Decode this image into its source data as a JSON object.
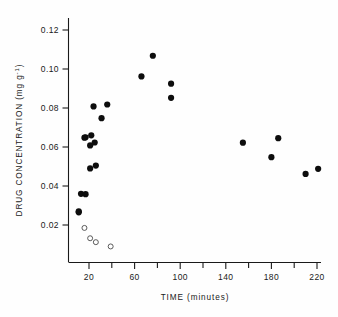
{
  "chart_data": {
    "type": "scatter",
    "title": "",
    "xlabel": "TIME  (minutes)",
    "ylabel": "DRUG CONCENTRATION  (mg g",
    "ylabel_superscript": "-1",
    "ylabel_suffix": ")",
    "xlim": [
      8,
      228
    ],
    "ylim": [
      0.0,
      0.128
    ],
    "xticks": [
      20,
      60,
      100,
      140,
      180,
      220
    ],
    "xtick_labels": [
      "20",
      "60",
      "100",
      "140",
      "180",
      "220"
    ],
    "xminor_ticks": [
      40,
      80,
      120,
      160,
      200
    ],
    "yticks": [
      0.02,
      0.04,
      0.06,
      0.08,
      0.1,
      0.12
    ],
    "ytick_labels": [
      "0.02",
      "0.04",
      "0.06",
      "0.08",
      "0.10",
      "0.12"
    ],
    "grid": false,
    "legend": null,
    "series": [
      {
        "name": "filled-markers",
        "marker": "filled-circle",
        "color": "#0d0d0d",
        "points": [
          {
            "x": 11,
            "y": 0.0265
          },
          {
            "x": 11,
            "y": 0.027
          },
          {
            "x": 13,
            "y": 0.036
          },
          {
            "x": 17,
            "y": 0.0358
          },
          {
            "x": 16,
            "y": 0.0648
          },
          {
            "x": 17,
            "y": 0.065
          },
          {
            "x": 21,
            "y": 0.0608
          },
          {
            "x": 22,
            "y": 0.066
          },
          {
            "x": 25,
            "y": 0.0623
          },
          {
            "x": 21,
            "y": 0.049
          },
          {
            "x": 26,
            "y": 0.0505
          },
          {
            "x": 24,
            "y": 0.0808
          },
          {
            "x": 31,
            "y": 0.0748
          },
          {
            "x": 36,
            "y": 0.0818
          },
          {
            "x": 66,
            "y": 0.0962
          },
          {
            "x": 76,
            "y": 0.1068
          },
          {
            "x": 92,
            "y": 0.0925
          },
          {
            "x": 92,
            "y": 0.0852
          },
          {
            "x": 155,
            "y": 0.0622
          },
          {
            "x": 180,
            "y": 0.0548
          },
          {
            "x": 186,
            "y": 0.0645
          },
          {
            "x": 210,
            "y": 0.0462
          },
          {
            "x": 221,
            "y": 0.0488
          }
        ]
      },
      {
        "name": "open-markers",
        "marker": "open-circle",
        "color": "#4a4a4a",
        "points": [
          {
            "x": 16,
            "y": 0.0185
          },
          {
            "x": 21,
            "y": 0.0132
          },
          {
            "x": 26,
            "y": 0.0112
          },
          {
            "x": 39,
            "y": 0.009
          }
        ]
      }
    ]
  }
}
